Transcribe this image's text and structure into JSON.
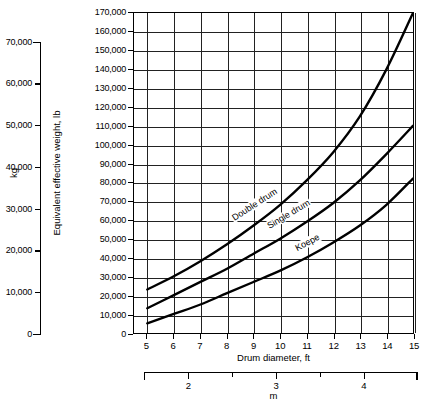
{
  "chart_data": {
    "type": "line",
    "title": "",
    "xlabel": "Drum diameter, ft",
    "ylabel": "Equivalent effective weight, lb",
    "secondary_xlabel": "m",
    "secondary_ylabel": "kg",
    "xlim": [
      4.5,
      15
    ],
    "ylim": [
      0,
      170000
    ],
    "grid": true,
    "legend": "inline-curve-labels",
    "x_ticks": [
      5,
      6,
      7,
      8,
      9,
      10,
      11,
      12,
      13,
      14,
      15
    ],
    "x_tick_labels": [
      "5",
      "6",
      "7",
      "8",
      "9",
      "10",
      "11",
      "12",
      "13",
      "14",
      "15"
    ],
    "y_ticks": [
      0,
      10000,
      20000,
      30000,
      40000,
      50000,
      60000,
      70000,
      80000,
      90000,
      100000,
      110000,
      120000,
      130000,
      140000,
      150000,
      160000,
      170000
    ],
    "y_tick_labels": [
      "0",
      "10,000",
      "20,000",
      "30,000",
      "40,000",
      "50,000",
      "60,000",
      "70,000",
      "80,000",
      "90,000",
      "100,000",
      "110,000",
      "120,000",
      "130,000",
      "140,000",
      "150,000",
      "160,000",
      "170,000"
    ],
    "kg_ticks": [
      0,
      10000,
      20000,
      30000,
      40000,
      50000,
      60000,
      70000
    ],
    "kg_tick_labels": [
      "0",
      "10,000",
      "20,000",
      "30,000",
      "40,000",
      "50,000",
      "60,000",
      "70,000"
    ],
    "m_major_ticks": [
      2,
      3,
      4
    ],
    "m_major_labels": [
      "2",
      "3",
      "4"
    ],
    "m_minor_ticks": [
      2.5,
      3.5
    ],
    "m_range": [
      1.5,
      4.6
    ],
    "series": [
      {
        "name": "Double drum",
        "label": "Double drum",
        "x": [
          5,
          6,
          7,
          8,
          9,
          10,
          11,
          12,
          13,
          14,
          15
        ],
        "values": [
          23000,
          30000,
          38000,
          47000,
          57000,
          68000,
          81000,
          96000,
          115000,
          140000,
          170000
        ]
      },
      {
        "name": "Single drum",
        "label": "Single drum",
        "x": [
          5,
          6,
          7,
          8,
          9,
          10,
          11,
          12,
          13,
          14,
          15
        ],
        "values": [
          13000,
          20000,
          27000,
          34000,
          42000,
          50000,
          59000,
          69000,
          81000,
          95000,
          110000
        ]
      },
      {
        "name": "Koepe",
        "label": "Koepe",
        "x": [
          5,
          6,
          7,
          8,
          9,
          10,
          11,
          12,
          13,
          14,
          15
        ],
        "values": [
          5000,
          10000,
          15000,
          21000,
          27000,
          33000,
          40000,
          48000,
          57000,
          68000,
          82000
        ]
      }
    ]
  },
  "colors": {
    "curve": "#000000",
    "grid": "#222222",
    "frame": "#000000",
    "background": "#ffffff"
  }
}
